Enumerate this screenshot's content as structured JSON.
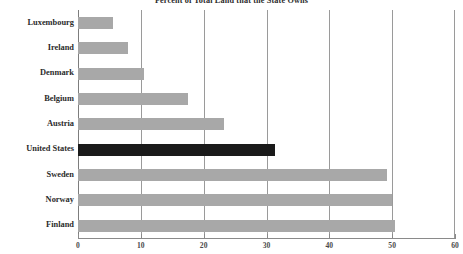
{
  "chart_data": {
    "type": "bar",
    "orientation": "horizontal",
    "title": "Percent of Total Land that the State Owns",
    "xlabel": "",
    "ylabel": "",
    "categories": [
      "Luxembourg",
      "Ireland",
      "Denmark",
      "Belgium",
      "Austria",
      "United States",
      "Sweden",
      "Norway",
      "Finland"
    ],
    "values": [
      5.6,
      8.0,
      10.5,
      17.5,
      23.2,
      31.4,
      49.2,
      50.0,
      50.5
    ],
    "xlim": [
      0,
      60
    ],
    "xticks": [
      0,
      10,
      20,
      30,
      40,
      50,
      60
    ],
    "xtick_labels": [
      "0",
      "10",
      "20",
      "30",
      "40",
      "50",
      "60"
    ],
    "grid": "vertical",
    "legend": "none",
    "highlight_category": "United States",
    "colors": {
      "bar": "#a8a8a8",
      "highlight_bar": "#1a1a1a",
      "gridline": "#9a9a9a",
      "axis": "#8a8a8a",
      "text": "#2b2b2b",
      "background": "#ffffff"
    }
  }
}
